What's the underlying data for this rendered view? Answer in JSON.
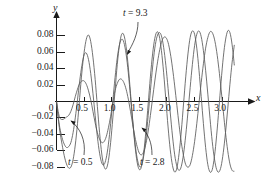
{
  "chart_data": {
    "type": "line",
    "title": "",
    "xlabel": "x",
    "ylabel": "y",
    "xlim": [
      0,
      3.25
    ],
    "ylim": [
      -0.095,
      0.095
    ],
    "grid": false,
    "legend": "none",
    "xticks": [
      0.5,
      1.0,
      1.5,
      2.0,
      2.5,
      3.0
    ],
    "xtick_labels": [
      "0.5",
      "1.0",
      "1.5",
      "2.0",
      "2.5",
      "3.0"
    ],
    "yticks": [
      0.08,
      0.06,
      0.04,
      0.02,
      0,
      -0.02,
      -0.04,
      -0.06,
      -0.08
    ],
    "ytick_labels": [
      "0.08",
      "0.06",
      "0.04",
      "0.02",
      "0",
      "−0.02",
      "−0.04",
      "−0.06",
      "−0.08"
    ],
    "series": [
      {
        "name": "t = 0.5",
        "annotation": "t = 0.5",
        "points": [
          [
            0.0,
            0.0
          ],
          [
            0.03,
            -0.012
          ],
          [
            0.06,
            -0.02
          ],
          [
            0.1,
            -0.022
          ],
          [
            0.14,
            -0.021
          ],
          [
            0.18,
            -0.019
          ],
          [
            0.22,
            -0.017
          ],
          [
            0.26,
            -0.012
          ],
          [
            0.3,
            -0.004
          ],
          [
            0.34,
            0.006
          ],
          [
            0.38,
            0.015
          ],
          [
            0.42,
            0.022
          ],
          [
            0.46,
            0.025
          ],
          [
            0.5,
            0.025
          ],
          [
            0.54,
            0.021
          ],
          [
            0.58,
            0.013
          ],
          [
            0.62,
            0.002
          ],
          [
            0.66,
            -0.012
          ],
          [
            0.7,
            -0.026
          ],
          [
            0.74,
            -0.038
          ],
          [
            0.78,
            -0.046
          ],
          [
            0.82,
            -0.05
          ],
          [
            0.86,
            -0.049
          ],
          [
            0.9,
            -0.043
          ],
          [
            0.94,
            -0.032
          ],
          [
            0.98,
            -0.018
          ],
          [
            1.02,
            -0.002
          ],
          [
            1.06,
            0.013
          ],
          [
            1.1,
            0.022
          ],
          [
            1.14,
            0.027
          ],
          [
            1.18,
            0.027
          ],
          [
            1.22,
            0.023
          ],
          [
            1.26,
            0.015
          ],
          [
            1.3,
            0.003
          ],
          [
            1.34,
            -0.012
          ],
          [
            1.38,
            -0.028
          ],
          [
            1.42,
            -0.043
          ],
          [
            1.46,
            -0.055
          ],
          [
            1.5,
            -0.063
          ],
          [
            1.54,
            -0.065
          ],
          [
            1.58,
            -0.061
          ],
          [
            1.62,
            -0.051
          ],
          [
            1.66,
            -0.036
          ],
          [
            1.7,
            -0.017
          ],
          [
            1.74,
            0.004
          ],
          [
            1.78,
            0.025
          ],
          [
            1.82,
            0.044
          ],
          [
            1.86,
            0.06
          ],
          [
            1.9,
            0.072
          ],
          [
            1.94,
            0.078
          ],
          [
            1.98,
            0.078
          ],
          [
            2.02,
            0.072
          ],
          [
            2.06,
            0.059
          ],
          [
            2.1,
            0.041
          ],
          [
            2.14,
            0.019
          ],
          [
            2.18,
            -0.005
          ],
          [
            2.22,
            -0.029
          ],
          [
            2.26,
            -0.05
          ],
          [
            2.3,
            -0.066
          ],
          [
            2.34,
            -0.077
          ],
          [
            2.38,
            -0.08
          ],
          [
            2.42,
            -0.077
          ],
          [
            2.46,
            -0.066
          ],
          [
            2.5,
            -0.049
          ],
          [
            2.54,
            -0.027
          ],
          [
            2.58,
            -0.002
          ],
          [
            2.62,
            0.023
          ],
          [
            2.66,
            0.046
          ],
          [
            2.7,
            0.065
          ],
          [
            2.74,
            0.078
          ],
          [
            2.78,
            0.085
          ],
          [
            2.82,
            0.084
          ],
          [
            2.86,
            0.076
          ],
          [
            2.9,
            0.061
          ],
          [
            2.94,
            0.04
          ],
          [
            2.98,
            0.015
          ],
          [
            3.02,
            -0.012
          ],
          [
            3.06,
            -0.038
          ],
          [
            3.1,
            -0.06
          ],
          [
            3.14,
            -0.076
          ],
          [
            3.18,
            -0.084
          ],
          [
            3.22,
            -0.085
          ]
        ]
      },
      {
        "name": "t = 2.8",
        "annotation": "t = 2.8",
        "points": [
          [
            0.0,
            0.0
          ],
          [
            0.03,
            -0.018
          ],
          [
            0.06,
            -0.032
          ],
          [
            0.1,
            -0.044
          ],
          [
            0.14,
            -0.052
          ],
          [
            0.18,
            -0.056
          ],
          [
            0.22,
            -0.055
          ],
          [
            0.26,
            -0.05
          ],
          [
            0.3,
            -0.038
          ],
          [
            0.34,
            -0.02
          ],
          [
            0.38,
            0.002
          ],
          [
            0.42,
            0.025
          ],
          [
            0.46,
            0.044
          ],
          [
            0.5,
            0.057
          ],
          [
            0.54,
            0.059
          ],
          [
            0.58,
            0.051
          ],
          [
            0.62,
            0.034
          ],
          [
            0.66,
            0.01
          ],
          [
            0.7,
            -0.017
          ],
          [
            0.74,
            -0.043
          ],
          [
            0.78,
            -0.063
          ],
          [
            0.82,
            -0.075
          ],
          [
            0.86,
            -0.077
          ],
          [
            0.9,
            -0.069
          ],
          [
            0.94,
            -0.052
          ],
          [
            0.98,
            -0.027
          ],
          [
            1.02,
            0.001
          ],
          [
            1.06,
            0.029
          ],
          [
            1.1,
            0.053
          ],
          [
            1.14,
            0.069
          ],
          [
            1.18,
            0.076
          ],
          [
            1.22,
            0.072
          ],
          [
            1.26,
            0.058
          ],
          [
            1.3,
            0.035
          ],
          [
            1.34,
            0.006
          ],
          [
            1.38,
            -0.024
          ],
          [
            1.42,
            -0.05
          ],
          [
            1.46,
            -0.069
          ],
          [
            1.5,
            -0.079
          ],
          [
            1.54,
            -0.078
          ],
          [
            1.58,
            -0.066
          ],
          [
            1.62,
            -0.045
          ],
          [
            1.66,
            -0.017
          ],
          [
            1.7,
            0.013
          ],
          [
            1.74,
            0.042
          ],
          [
            1.78,
            0.065
          ],
          [
            1.82,
            0.079
          ],
          [
            1.86,
            0.084
          ],
          [
            1.9,
            0.08
          ],
          [
            1.94,
            0.066
          ],
          [
            1.98,
            0.044
          ],
          [
            2.02,
            0.016
          ],
          [
            2.06,
            -0.014
          ],
          [
            2.1,
            -0.042
          ],
          [
            2.14,
            -0.065
          ],
          [
            2.18,
            -0.079
          ],
          [
            2.22,
            -0.084
          ],
          [
            2.26,
            -0.079
          ],
          [
            2.3,
            -0.064
          ],
          [
            2.34,
            -0.041
          ],
          [
            2.38,
            -0.013
          ],
          [
            2.42,
            0.017
          ],
          [
            2.46,
            0.045
          ],
          [
            2.5,
            0.068
          ],
          [
            2.54,
            0.082
          ],
          [
            2.58,
            0.086
          ],
          [
            2.62,
            0.079
          ],
          [
            2.66,
            0.062
          ],
          [
            2.7,
            0.038
          ],
          [
            2.74,
            0.009
          ],
          [
            2.78,
            -0.021
          ],
          [
            2.82,
            -0.049
          ],
          [
            2.86,
            -0.07
          ],
          [
            2.9,
            -0.083
          ],
          [
            2.94,
            -0.086
          ],
          [
            2.98,
            -0.079
          ],
          [
            3.02,
            -0.062
          ],
          [
            3.06,
            -0.038
          ],
          [
            3.1,
            -0.009
          ],
          [
            3.14,
            0.021
          ],
          [
            3.18,
            0.048
          ],
          [
            3.22,
            0.069
          ]
        ]
      },
      {
        "name": "t = 9.3",
        "annotation": "t = 9.3",
        "points": [
          [
            0.0,
            0.0
          ],
          [
            0.03,
            -0.02
          ],
          [
            0.06,
            -0.036
          ],
          [
            0.1,
            -0.052
          ],
          [
            0.14,
            -0.066
          ],
          [
            0.18,
            -0.076
          ],
          [
            0.22,
            -0.081
          ],
          [
            0.26,
            -0.08
          ],
          [
            0.3,
            -0.071
          ],
          [
            0.34,
            -0.053
          ],
          [
            0.38,
            -0.027
          ],
          [
            0.42,
            0.005
          ],
          [
            0.46,
            0.036
          ],
          [
            0.5,
            0.06
          ],
          [
            0.54,
            0.076
          ],
          [
            0.58,
            0.081
          ],
          [
            0.62,
            0.073
          ],
          [
            0.66,
            0.054
          ],
          [
            0.7,
            0.027
          ],
          [
            0.74,
            -0.006
          ],
          [
            0.78,
            -0.038
          ],
          [
            0.82,
            -0.064
          ],
          [
            0.86,
            -0.079
          ],
          [
            0.9,
            -0.082
          ],
          [
            0.94,
            -0.072
          ],
          [
            0.98,
            -0.05
          ],
          [
            1.02,
            -0.02
          ],
          [
            1.06,
            0.013
          ],
          [
            1.1,
            0.045
          ],
          [
            1.14,
            0.069
          ],
          [
            1.18,
            0.082
          ],
          [
            1.22,
            0.081
          ],
          [
            1.26,
            0.067
          ],
          [
            1.3,
            0.042
          ],
          [
            1.34,
            0.01
          ],
          [
            1.38,
            -0.023
          ],
          [
            1.42,
            -0.053
          ],
          [
            1.46,
            -0.074
          ],
          [
            1.5,
            -0.083
          ],
          [
            1.54,
            -0.079
          ],
          [
            1.58,
            -0.062
          ],
          [
            1.62,
            -0.035
          ],
          [
            1.66,
            -0.003
          ],
          [
            1.7,
            0.03
          ],
          [
            1.74,
            0.058
          ],
          [
            1.78,
            0.077
          ],
          [
            1.82,
            0.085
          ],
          [
            1.86,
            0.08
          ],
          [
            1.9,
            0.062
          ],
          [
            1.94,
            0.035
          ],
          [
            1.98,
            0.002
          ],
          [
            2.02,
            -0.031
          ],
          [
            2.06,
            -0.059
          ],
          [
            2.1,
            -0.078
          ],
          [
            2.14,
            -0.086
          ],
          [
            2.18,
            -0.081
          ],
          [
            2.22,
            -0.063
          ],
          [
            2.26,
            -0.036
          ],
          [
            2.3,
            -0.003
          ],
          [
            2.34,
            0.03
          ],
          [
            2.38,
            0.058
          ],
          [
            2.42,
            0.078
          ],
          [
            2.46,
            0.086
          ],
          [
            2.5,
            0.082
          ],
          [
            2.54,
            0.065
          ],
          [
            2.58,
            0.038
          ],
          [
            2.62,
            0.006
          ],
          [
            2.66,
            -0.027
          ],
          [
            2.7,
            -0.056
          ],
          [
            2.74,
            -0.077
          ],
          [
            2.78,
            -0.086
          ],
          [
            2.82,
            -0.083
          ],
          [
            2.86,
            -0.067
          ],
          [
            2.9,
            -0.041
          ],
          [
            2.94,
            -0.009
          ],
          [
            2.98,
            0.024
          ],
          [
            3.02,
            0.054
          ],
          [
            3.06,
            0.075
          ],
          [
            3.1,
            0.086
          ],
          [
            3.14,
            0.084
          ],
          [
            3.18,
            0.069
          ],
          [
            3.22,
            0.044
          ]
        ]
      }
    ],
    "annotations": [
      {
        "text": "t = 9.3",
        "x": 1.28,
        "y": 0.098
      },
      {
        "text": "t = 0.5",
        "x": 0.4,
        "y": -0.108
      },
      {
        "text": "t = 2.8",
        "x": 1.57,
        "y": -0.108
      }
    ]
  },
  "labels": {
    "x_axis": "x",
    "y_axis": "y",
    "t_high": "t = 9.3",
    "t_low": "t = 0.5",
    "t_mid": "t = 2.8"
  },
  "colors": {
    "axis": "#1a1a1a",
    "curve": "#5a5a5a",
    "text": "#1a1a1a",
    "background": "#ffffff"
  }
}
